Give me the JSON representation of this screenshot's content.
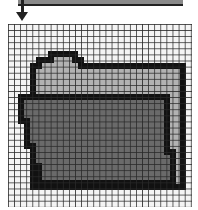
{
  "toolbar": {
    "bar_color": "#8a8a8a",
    "arrow_icon": "arrow-down-icon"
  },
  "canvas": {
    "grid_columns": 30,
    "grid_rows": 30,
    "background_color": "#f4f4f4",
    "gridline_color": "#282828",
    "icon": "folder-icon",
    "colors": {
      "outline": "#111111",
      "back_folder": "#b2b2b2",
      "front_folder": "#6a6a6a"
    }
  }
}
